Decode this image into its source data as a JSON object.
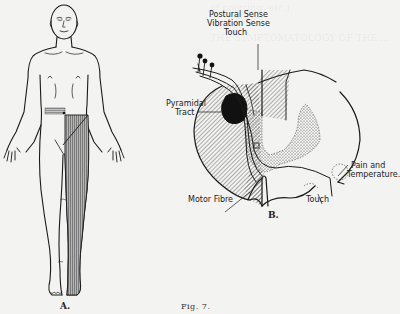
{
  "figure": {
    "number_label": "Fig. 7.",
    "panel_a": {
      "caption": "A.",
      "subject": "anterior body outline with shaded left lower limb and abdominal band"
    },
    "panel_b": {
      "caption": "B.",
      "subject": "spinal cord cross-section with tracts",
      "labels": {
        "postural_sense": "Postural Sense",
        "vibration_sense": "Vibration Sense",
        "touch_top": "Touch",
        "pyramidal_tract_1": "Pyramidal",
        "pyramidal_tract_2": "Tract",
        "pain_temp_1": "Pain and",
        "pain_temp_2": "Temperature.",
        "motor_fibre": "Motor Fibre",
        "touch_bottom": "Touch"
      }
    }
  },
  "background_text": {
    "faint_heading": "THE SYMPTOMS OF THE ... LESIONS",
    "faint_lines": [
      "of pointing, etc.).",
      "",
      "THE SYMPTOMATOLOGY OF THE ... LESIONS",
      "A few ... ",
      "... ",
      "... ",
      "... ",
      "... ",
      "... ",
      "... ",
      "... ",
      "... ",
      "... ",
      "... ",
      "... ",
      "... ",
      "... ",
      "... "
    ]
  },
  "colors": {
    "ink": "#1a1a1a",
    "paper": "#f3f3f1",
    "hatch": "#777777",
    "shade": "#8a8a8a"
  }
}
